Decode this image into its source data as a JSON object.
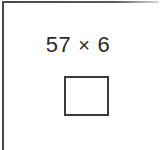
{
  "page": {
    "type": "math-worksheet-problem",
    "background_color": "#ffffff",
    "rule_color": "#4a4a4a",
    "ink_color": "#2b2b2b",
    "box_border_color": "#3a3a3a"
  },
  "problem": {
    "expression": "57 × 6",
    "first_operand": "57",
    "operator": "×",
    "operator_name": "multiplication-sign",
    "second_operand": "6"
  },
  "answer": {
    "value": "",
    "placeholder": ""
  }
}
